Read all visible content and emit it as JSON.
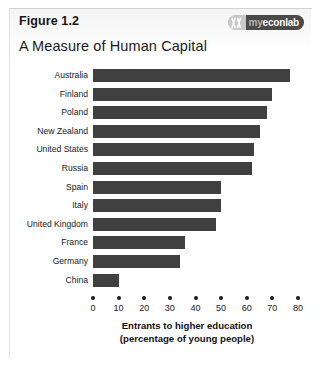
{
  "figure": {
    "label": "Figure 1.2",
    "title": "A Measure of Human Capital"
  },
  "logo": {
    "name": "myeconlab-logo",
    "text_prefix": "my",
    "text_main": "econ",
    "text_suffix": "lab",
    "full_text": "myeconlab"
  },
  "colors": {
    "bar": "#404040",
    "text": "#1b1b1b",
    "logo_bar": "#4a4a4a",
    "page_border": "#d2d2d2"
  },
  "chart_data": {
    "type": "bar",
    "orientation": "horizontal",
    "title": "A Measure of Human Capital",
    "xlabel": "Entrants to higher education (percentage of young people)",
    "xlabel_line1": "Entrants to higher education",
    "xlabel_line2": "(percentage of young people)",
    "ylabel": "",
    "categories": [
      "Australia",
      "Finland",
      "Poland",
      "New Zealand",
      "United States",
      "Russia",
      "Spain",
      "Italy",
      "United Kingdom",
      "France",
      "Germany",
      "China"
    ],
    "values": [
      77,
      70,
      68,
      65,
      63,
      62,
      50,
      50,
      48,
      36,
      34,
      10
    ],
    "xlim": [
      0,
      80
    ],
    "xticks": [
      0,
      10,
      20,
      30,
      40,
      50,
      60,
      70,
      80
    ],
    "xtick_labels": [
      "0",
      "10",
      "20",
      "30",
      "40",
      "50",
      "60",
      "70",
      "80"
    ],
    "grid": false,
    "legend": false
  }
}
